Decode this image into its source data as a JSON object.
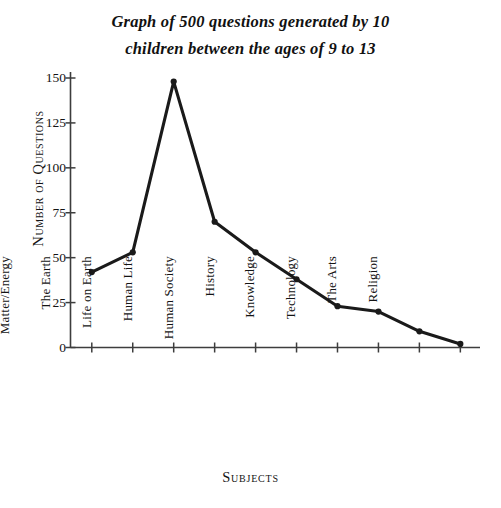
{
  "chart_data": {
    "type": "line",
    "title": "Graph of 500 questions generated by 10 children between the ages of 9 to 13",
    "title_lines": [
      "Graph of 500 questions generated by 10",
      "children between the ages of 9 to 13"
    ],
    "xlabel": "Subjects",
    "ylabel": "Number of Questions",
    "categories": [
      "Matter/Energy",
      "The Earth",
      "Life on Earth",
      "Human Life",
      "Human Society",
      "History",
      "Knowledge",
      "Technology",
      "The Arts",
      "Religion"
    ],
    "values": [
      42,
      53,
      148,
      70,
      53,
      38,
      23,
      20,
      9,
      2
    ],
    "ylim": [
      0,
      150
    ],
    "yticks": [
      0,
      25,
      50,
      75,
      100,
      125,
      150
    ],
    "ytick_labels": [
      "0",
      "25",
      "50",
      "75",
      "100",
      "125",
      "150"
    ],
    "grid": false,
    "legend": "none",
    "marker": "circle",
    "line_color": "#1a1a1a",
    "axis_color": "#3d3d3d",
    "background_color": "#ffffff"
  }
}
